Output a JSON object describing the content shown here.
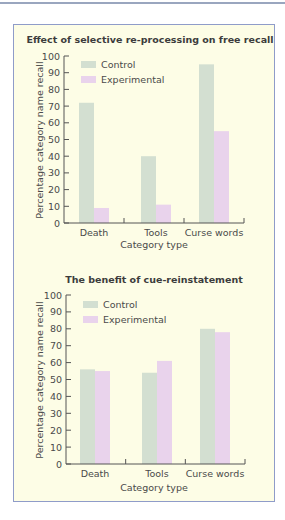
{
  "chart_data": [
    {
      "type": "bar",
      "title": "Effect of selective re-processing on free recall",
      "xlabel": "Category type",
      "ylabel": "Percentage category name recall",
      "categories": [
        "Death",
        "Tools",
        "Curse words"
      ],
      "series": [
        {
          "name": "Control",
          "values": [
            72,
            40,
            95
          ],
          "color": "#d3dfd1"
        },
        {
          "name": "Experimental",
          "values": [
            9,
            11,
            55
          ],
          "color": "#e9d3ec"
        }
      ],
      "ylim": [
        0,
        100
      ],
      "yticks": [
        0,
        10,
        20,
        30,
        40,
        50,
        60,
        70,
        80,
        90,
        100
      ],
      "grid": false,
      "legend": "top-left"
    },
    {
      "type": "bar",
      "title": "The benefit of cue-reinstatement",
      "xlabel": "Category type",
      "ylabel": "Percentage category name recall",
      "categories": [
        "Death",
        "Tools",
        "Curse words"
      ],
      "series": [
        {
          "name": "Control",
          "values": [
            56,
            54,
            80
          ],
          "color": "#d3dfd1"
        },
        {
          "name": "Experimental",
          "values": [
            55,
            61,
            78
          ],
          "color": "#e9d3ec"
        }
      ],
      "ylim": [
        0,
        100
      ],
      "yticks": [
        0,
        10,
        20,
        30,
        40,
        50,
        60,
        70,
        80,
        90,
        100
      ],
      "grid": false,
      "legend": "top-left"
    }
  ]
}
